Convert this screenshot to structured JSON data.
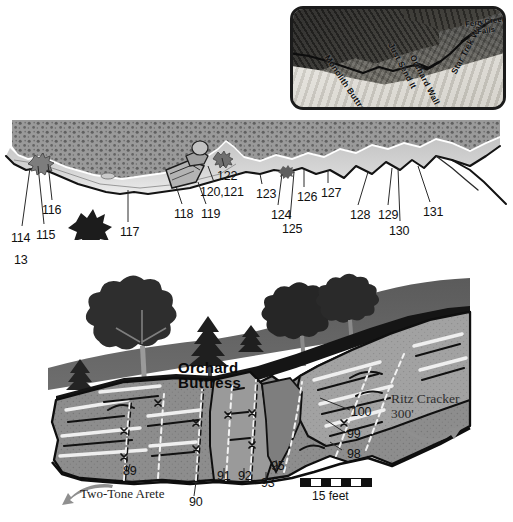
{
  "inset": {
    "name": "overview-aerial-photo",
    "labels": [
      {
        "text": "Monolith Buttress",
        "x": 42,
        "y": 46,
        "rot": 56,
        "size": 8.5
      },
      {
        "text": "Just Send It",
        "x": 104,
        "y": 34,
        "rot": 62,
        "size": 8.5
      },
      {
        "text": "Orchard Wall",
        "x": 128,
        "y": 46,
        "rot": 63,
        "size": 8.5
      },
      {
        "text": "Star Trek Wall",
        "x": 160,
        "y": 20,
        "rot": -66,
        "size": 8.5
      },
      {
        "text": "Fern Creek",
        "x": 180,
        "y": 8,
        "rot": 0,
        "size": 7.5
      },
      {
        "text": "Falls",
        "x": 189,
        "y": 16,
        "rot": 0,
        "size": 7.5
      }
    ]
  },
  "band_diagram": {
    "name": "upper-cliff-band-profile",
    "labels": [
      {
        "text": "13",
        "x": 14,
        "y": 143
      },
      {
        "text": "114",
        "x": 12,
        "y": 121
      },
      {
        "text": "115",
        "x": 37,
        "y": 118
      },
      {
        "text": "116",
        "x": 43,
        "y": 94
      },
      {
        "text": "117",
        "x": 121,
        "y": 116
      },
      {
        "text": "118",
        "x": 176,
        "y": 98
      },
      {
        "text": "119",
        "x": 202,
        "y": 98
      },
      {
        "text": "120,121",
        "x": 202,
        "y": 76
      },
      {
        "text": "122",
        "x": 218,
        "y": 60
      },
      {
        "text": "123",
        "x": 257,
        "y": 78
      },
      {
        "text": "124",
        "x": 272,
        "y": 99
      },
      {
        "text": "125",
        "x": 283,
        "y": 113
      },
      {
        "text": "126",
        "x": 298,
        "y": 81
      },
      {
        "text": "127",
        "x": 322,
        "y": 77
      },
      {
        "text": "128",
        "x": 351,
        "y": 99
      },
      {
        "text": "129",
        "x": 379,
        "y": 99
      },
      {
        "text": "130",
        "x": 390,
        "y": 115
      },
      {
        "text": "131",
        "x": 424,
        "y": 96
      }
    ]
  },
  "lower_diagram": {
    "name": "orchard-buttress-detail",
    "title_line1": "Orchard",
    "title_line2": "Buttress",
    "route_ritz_name": "Ritz Cracker",
    "route_ritz_length": "300'",
    "route_arete_name": "Two-Tone Arete",
    "scale_caption": "15 feet",
    "labels": [
      {
        "text": "89",
        "x": 124,
        "y": 218
      },
      {
        "text": "90",
        "x": 190,
        "y": 238
      },
      {
        "text": "91",
        "x": 218,
        "y": 222
      },
      {
        "text": "92",
        "x": 239,
        "y": 222
      },
      {
        "text": "93",
        "x": 262,
        "y": 229
      },
      {
        "text": "95",
        "x": 272,
        "y": 212
      },
      {
        "text": "98",
        "x": 348,
        "y": 200
      },
      {
        "text": "99",
        "x": 348,
        "y": 180
      },
      {
        "text": "100",
        "x": 352,
        "y": 158
      }
    ]
  },
  "colors": {
    "rock_mid": "#8e8e8e",
    "rock_light": "#bdbdbd",
    "rock_dark": "#4d4d4d",
    "ink": "#111111",
    "paper": "#ffffff"
  }
}
